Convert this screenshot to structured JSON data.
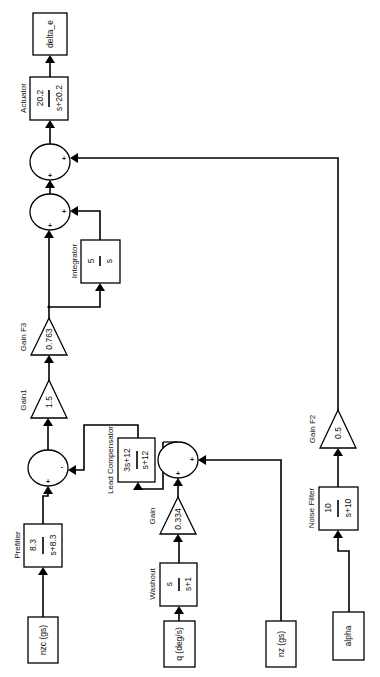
{
  "diagram": {
    "type": "block_diagram",
    "orientation": "rotated-90-ccw",
    "colors": {
      "background": "#ffffff",
      "stroke": "#000000",
      "text": "#111111"
    },
    "inputs": {
      "nzc": "nzc (gs)",
      "q": "q (deg/s)",
      "nz": "nz (gs)",
      "alpha": "alpha"
    },
    "output": {
      "delta_e": "delta_e"
    },
    "blocks": {
      "prefilter": {
        "name": "Prefilter",
        "num": "8.3",
        "den": "s+8.3"
      },
      "gain1": {
        "name": "Gain1",
        "value": "1.5"
      },
      "gain_f3": {
        "name": "Gain F3",
        "value": "0.763"
      },
      "integrator": {
        "name": "Integrator",
        "num": "5",
        "den": "s"
      },
      "actuator": {
        "name": "Actuator",
        "num": "20.2",
        "den": "s+20.2"
      },
      "lead": {
        "name": "Lead Compensator",
        "num": "3s+12",
        "den": "s+12"
      },
      "gain": {
        "name": "Gain",
        "value": "0.334"
      },
      "washout": {
        "name": "Washout",
        "num": "s",
        "den": "s+1"
      },
      "noise": {
        "name": "Noise Filter",
        "num": "10",
        "den": "s+10"
      },
      "gain_f2": {
        "name": "Gain F2",
        "value": "0.5"
      }
    },
    "sums": {
      "sum1": {
        "signs": [
          "+",
          "-"
        ]
      },
      "sum2": {
        "signs": [
          "+",
          "+"
        ]
      },
      "sum3": {
        "signs": [
          "+",
          "+"
        ]
      },
      "sum4": {
        "signs": [
          "+",
          "+"
        ]
      }
    }
  }
}
